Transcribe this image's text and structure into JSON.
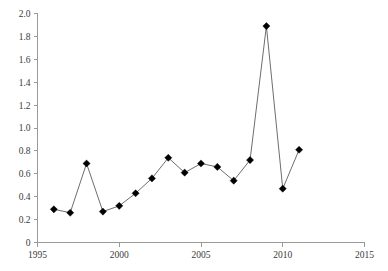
{
  "chart_data": {
    "type": "line",
    "title": "",
    "subtitle": "",
    "xlabel": "",
    "ylabel": "",
    "x": [
      1996,
      1997,
      1998,
      1999,
      2000,
      2001,
      2002,
      2003,
      2004,
      2005,
      2006,
      2007,
      2008,
      2009,
      2010,
      2011
    ],
    "values": [
      0.29,
      0.26,
      0.69,
      0.27,
      0.32,
      0.43,
      0.56,
      0.74,
      0.61,
      0.69,
      0.66,
      0.54,
      0.72,
      1.89,
      0.47,
      0.81
    ],
    "series": [
      {
        "name": "",
        "values": [
          0.29,
          0.26,
          0.69,
          0.27,
          0.32,
          0.43,
          0.56,
          0.74,
          0.61,
          0.69,
          0.66,
          0.54,
          0.72,
          1.89,
          0.47,
          0.81
        ]
      }
    ],
    "xlim": [
      1995,
      2015
    ],
    "ylim": [
      0,
      2.0
    ],
    "xticks": [
      1995,
      2000,
      2005,
      2010,
      2015
    ],
    "xtick_labels": [
      "1995",
      "2000",
      "2005",
      "2010",
      "2015"
    ],
    "yticks": [
      0,
      0.2,
      0.4,
      0.6,
      0.8,
      1.0,
      1.2,
      1.4,
      1.6,
      1.8,
      2.0
    ],
    "ytick_labels": [
      "0",
      "0.2",
      "0.4",
      "0.6",
      "0.8",
      "1.0",
      "1.2",
      "1.4",
      "1.6",
      "1.8",
      "2.0"
    ],
    "grid": false,
    "legend": false,
    "legend_position": "none",
    "marker": "diamond",
    "marker_color": "#000000",
    "line_color": "#6e6e6e",
    "axis_color": "#9a9a96",
    "background_color": "#ffffff",
    "annotations": []
  }
}
